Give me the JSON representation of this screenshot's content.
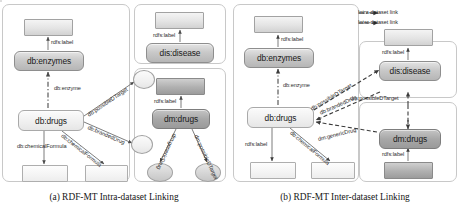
{
  "figure": {
    "captions": {
      "a": "(a) RDF-MT Intra-dataset Linking",
      "b": "(b) RDF-MT Inter-dataset Linking"
    },
    "legend": {
      "intra": "Intra-dataset link",
      "inter": "Inter-dataset link"
    },
    "colors": {
      "node_fill": "#c9c9c9",
      "node_dark_fill": "#a8a8a8",
      "attr_fill": "#e4e4e4",
      "panel_border": "#c8c8c8",
      "edge": "#6e6e6e",
      "text": "#1a1a1a"
    }
  },
  "diagram_a": {
    "nodes": [
      {
        "id": "db_enzymes",
        "label": "db:enzymes"
      },
      {
        "id": "db_drugs",
        "label": "db:drugs"
      },
      {
        "id": "dis_disease",
        "label": "dis:disease"
      },
      {
        "id": "dm_drugs",
        "label": "dm:drugs"
      }
    ],
    "edges": [
      {
        "label": "rdfs:label",
        "kind": "intra"
      },
      {
        "label": "db:enzyme",
        "kind": "intra"
      },
      {
        "label": "db:possibleDTarget",
        "kind": "intra"
      },
      {
        "label": "db:brandedDrug",
        "kind": "intra"
      },
      {
        "label": "db:chemicalFormula",
        "kind": "intra"
      },
      {
        "label": "rdfs:label",
        "kind": "intra"
      },
      {
        "label": "rdfs:label",
        "kind": "intra"
      },
      {
        "label": "rdfs:label",
        "kind": "intra"
      },
      {
        "label": "dm:genericDrug",
        "kind": "intra"
      },
      {
        "label": "dm:possibleDTarget",
        "kind": "intra"
      }
    ]
  },
  "diagram_b": {
    "nodes": [
      {
        "id": "db_enzymes",
        "label": "db:enzymes"
      },
      {
        "id": "db_drugs",
        "label": "db:drugs"
      },
      {
        "id": "dis_disease",
        "label": "dis:disease"
      },
      {
        "id": "dm_drugs",
        "label": "dm:drugs"
      }
    ],
    "edges": [
      {
        "label": "rdfs:label",
        "kind": "intra"
      },
      {
        "label": "db:enzyme",
        "kind": "intra"
      },
      {
        "label": "rdfs:label",
        "kind": "intra"
      },
      {
        "label": "rdfs:label",
        "kind": "intra"
      },
      {
        "label": "rdfs:label",
        "kind": "intra"
      },
      {
        "label": "db:chemicalFormula",
        "kind": "intra"
      },
      {
        "label": "db:possibleDTarget",
        "kind": "inter"
      },
      {
        "label": "db:brandedDrug",
        "kind": "inter"
      },
      {
        "label": "dm:genericDrug",
        "kind": "inter"
      },
      {
        "label": "dm:possibleDTarget",
        "kind": "inter"
      }
    ]
  }
}
